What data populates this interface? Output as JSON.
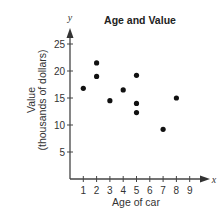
{
  "chart_data": {
    "type": "scatter",
    "title": "Age and Value",
    "xlabel": "Age of car",
    "ylabel": "Value",
    "ylabel_line2": "(thousands of dollars)",
    "x_var": "x",
    "y_var": "y",
    "xlim": [
      0,
      9
    ],
    "ylim": [
      0,
      27
    ],
    "x_ticks": [
      "1",
      "2",
      "3",
      "4",
      "5",
      "6",
      "7",
      "8",
      "9"
    ],
    "y_ticks": [
      "5",
      "10",
      "15",
      "20",
      "25"
    ],
    "grid": false,
    "legend": null,
    "points": [
      {
        "x": 1,
        "y": 16.8
      },
      {
        "x": 2,
        "y": 21.5
      },
      {
        "x": 2,
        "y": 19
      },
      {
        "x": 3,
        "y": 14.5
      },
      {
        "x": 4,
        "y": 16.5
      },
      {
        "x": 5,
        "y": 19.2
      },
      {
        "x": 5,
        "y": 14
      },
      {
        "x": 5,
        "y": 12.3
      },
      {
        "x": 7,
        "y": 9.2
      },
      {
        "x": 8,
        "y": 15
      }
    ]
  }
}
